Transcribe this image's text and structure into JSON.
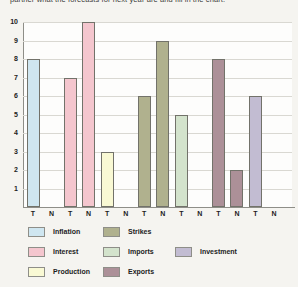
{
  "caption": "partner what the forecasts for next year are and fill in the chart.",
  "chart_data": {
    "type": "bar",
    "title": "",
    "xlabel": "",
    "ylabel": "",
    "ylim": [
      0,
      10
    ],
    "yticks": [
      1,
      2,
      3,
      4,
      5,
      6,
      7,
      8,
      9,
      10
    ],
    "grid": true,
    "slot_labels": [
      "T",
      "N"
    ],
    "groups": [
      {
        "name": "Inflation",
        "color": "#cfe6f0",
        "values": {
          "T": 8,
          "N": null
        }
      },
      {
        "name": "Interest",
        "color": "#f4c6ce",
        "values": {
          "T": 7,
          "N": 10
        }
      },
      {
        "name": "Production",
        "color": "#f9f9d4",
        "values": {
          "T": 3,
          "N": null
        }
      },
      {
        "name": "Strikes",
        "color": "#b0b18e",
        "values": {
          "T": 6,
          "N": 9
        }
      },
      {
        "name": "Imports",
        "color": "#d3e3cc",
        "values": {
          "T": 5,
          "N": null
        }
      },
      {
        "name": "Exports",
        "color": "#ac9098",
        "values": {
          "T": 8,
          "N": 2
        }
      },
      {
        "name": "Investment",
        "color": "#c2bcd2",
        "values": {
          "T": 6,
          "N": null
        }
      }
    ],
    "legend_position": "bottom"
  },
  "legend": {
    "items": [
      {
        "label": "Inflation",
        "color": "#cfe6f0",
        "col": 0,
        "row": 0
      },
      {
        "label": "Interest",
        "color": "#f4c6ce",
        "col": 0,
        "row": 1
      },
      {
        "label": "Production",
        "color": "#f9f9d4",
        "col": 0,
        "row": 2
      },
      {
        "label": "Strikes",
        "color": "#b0b18e",
        "col": 1,
        "row": 0
      },
      {
        "label": "Imports",
        "color": "#d3e3cc",
        "col": 1,
        "row": 1
      },
      {
        "label": "Exports",
        "color": "#ac9098",
        "col": 1,
        "row": 2
      },
      {
        "label": "Investment",
        "color": "#c2bcd2",
        "col": 2,
        "row": 1
      }
    ]
  }
}
